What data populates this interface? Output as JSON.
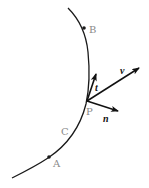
{
  "diagram": {
    "colors": {
      "curve": "#1a1a1a",
      "point_label": "#8a8a8a",
      "vector": "#111111",
      "vector_label": "#111111"
    },
    "curve": {
      "label": "C"
    },
    "points": [
      {
        "id": "B",
        "label": "B"
      },
      {
        "id": "P",
        "label": "P"
      },
      {
        "id": "A",
        "label": "A"
      }
    ],
    "vectors": [
      {
        "id": "t",
        "label": "t",
        "meaning": "unit tangent"
      },
      {
        "id": "v",
        "label": "v",
        "meaning": "velocity"
      },
      {
        "id": "n",
        "label": "n",
        "meaning": "unit normal"
      }
    ]
  }
}
